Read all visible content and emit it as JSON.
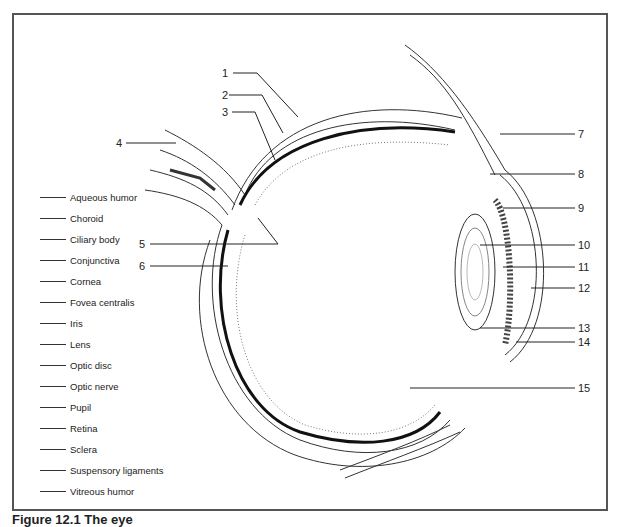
{
  "figure": {
    "caption": "Figure 12.1  The eye",
    "terms": [
      "Aqueous humor",
      "Choroid",
      "Ciliary body",
      "Conjunctiva",
      "Cornea",
      "Fovea centralis",
      "Iris",
      "Lens",
      "Optic disc",
      "Optic nerve",
      "Pupil",
      "Retina",
      "Sclera",
      "Suspensory ligaments",
      "Vitreous humor"
    ],
    "labels": [
      "1",
      "2",
      "3",
      "4",
      "5",
      "6",
      "7",
      "8",
      "9",
      "10",
      "11",
      "12",
      "13",
      "14",
      "15"
    ]
  }
}
